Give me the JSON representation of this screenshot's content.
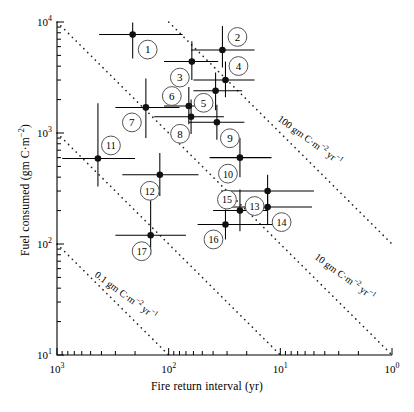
{
  "chart_data": {
    "type": "scatter",
    "title": "",
    "xlabel": "Fire return interval (yr)",
    "ylabel": "Fuel consumed (gm C·m−2)",
    "ylabel_html": "Fuel consumed (gm C·m<sup>−2</sup>)",
    "xscale": "log",
    "yscale": "log",
    "x_reversed": true,
    "xlim": [
      1000,
      1
    ],
    "ylim": [
      10,
      10000
    ],
    "grid": false,
    "legend": null,
    "xticks": [
      1000,
      100,
      10,
      1
    ],
    "xtick_labels": [
      "10³",
      "10²",
      "10¹",
      "10⁰"
    ],
    "yticks": [
      10,
      100,
      1000,
      10000
    ],
    "ytick_labels": [
      "10¹",
      "10²",
      "10³",
      "10⁴"
    ],
    "minor_ticks": true,
    "marker": "filled-circle",
    "error_bars": "x and y",
    "points": [
      {
        "label": "1",
        "x": 210,
        "y": 7700,
        "xlo": 420,
        "xhi": 75,
        "ylo": 4700,
        "yhi": 9900
      },
      {
        "label": "2",
        "x": 33,
        "y": 5600,
        "xlo": 63,
        "xhi": 17,
        "ylo": 3900,
        "yhi": 9200
      },
      {
        "label": "3",
        "x": 62,
        "y": 4400,
        "xlo": 110,
        "xhi": 36,
        "ylo": 3000,
        "yhi": 6700
      },
      {
        "label": "4",
        "x": 31,
        "y": 3000,
        "xlo": 60,
        "xhi": 17,
        "ylo": 2100,
        "yhi": 4400
      },
      {
        "label": "5",
        "x": 38,
        "y": 2400,
        "xlo": 60,
        "xhi": 22,
        "ylo": 1600,
        "yhi": 3500
      },
      {
        "label": "6",
        "x": 66,
        "y": 1750,
        "xlo": 110,
        "xhi": 40,
        "ylo": 1200,
        "yhi": 2600
      },
      {
        "label": "7",
        "x": 160,
        "y": 1700,
        "xlo": 300,
        "xhi": 80,
        "ylo": 900,
        "yhi": 3100
      },
      {
        "label": "8",
        "x": 63,
        "y": 1400,
        "xlo": 135,
        "xhi": 32,
        "ylo": 980,
        "yhi": 2000
      },
      {
        "label": "9",
        "x": 37,
        "y": 1250,
        "xlo": 66,
        "xhi": 21,
        "ylo": 870,
        "yhi": 1800
      },
      {
        "label": "10",
        "x": 23,
        "y": 600,
        "xlo": 43,
        "xhi": 12,
        "ylo": 400,
        "yhi": 900
      },
      {
        "label": "11",
        "x": 430,
        "y": 590,
        "xlo": 900,
        "xhi": 200,
        "ylo": 330,
        "yhi": 1850
      },
      {
        "label": "12",
        "x": 120,
        "y": 420,
        "xlo": 260,
        "xhi": 54,
        "ylo": 270,
        "yhi": 660
      },
      {
        "label": "13",
        "x": 13,
        "y": 300,
        "xlo": 34,
        "xhi": 5.0,
        "ylo": 215,
        "yhi": 420
      },
      {
        "label": "14",
        "x": 13,
        "y": 215,
        "xlo": 34,
        "xhi": 5.2,
        "ylo": 150,
        "yhi": 310
      },
      {
        "label": "15",
        "x": 23,
        "y": 200,
        "xlo": 40,
        "xhi": 13,
        "ylo": 130,
        "yhi": 310
      },
      {
        "label": "16",
        "x": 31,
        "y": 150,
        "xlo": 55,
        "xhi": 10,
        "ylo": 110,
        "yhi": 205
      },
      {
        "label": "17",
        "x": 145,
        "y": 120,
        "xlo": 300,
        "xhi": 70,
        "ylo": 80,
        "yhi": 250
      }
    ],
    "isopleths": [
      {
        "value": 0.1,
        "label": "0.1 gm C·m−2 yr−1",
        "label_html": "0.1 gm C·m<sup>−2</sup> yr<sup>−1</sup>"
      },
      {
        "value": 1.0,
        "label": "1.0 gm C·m−2 yr−1",
        "label_html": "1.0 gm C·m<sup>−2</sup> yr<sup>−1</sup>"
      },
      {
        "value": 10.0,
        "label": "10 gm C·m−2 yr−1",
        "label_html": "10 gm C·m<sup>−2</sup> yr<sup>−1</sup>"
      },
      {
        "value": 100.0,
        "label": "100 gm C·m−2 yr−1",
        "label_html": "100 gm C·m<sup>−2</sup> yr<sup>−1</sup>"
      }
    ],
    "isopleth_style": "dotted",
    "annotation_style": "numbered circle callouts"
  },
  "axis": {
    "x_title": "Fire return interval (yr)",
    "y_title_html": "Fuel consumed (gm C·m<sup>−2</sup>)",
    "x_tick_labels": [
      "10³",
      "10²",
      "10¹",
      "10⁰"
    ],
    "y_tick_labels": [
      "10⁴",
      "10³",
      "10²",
      "10¹"
    ]
  },
  "colors": {
    "ink": "#000000",
    "background": "#ffffff",
    "marker": "#111111",
    "isopleth": "#222222"
  }
}
